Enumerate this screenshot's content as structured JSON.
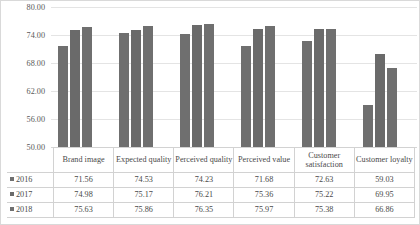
{
  "chart_data": {
    "type": "bar",
    "title": "",
    "xlabel": "",
    "ylabel": "",
    "ylim": [
      50,
      80
    ],
    "yticks": [
      "80.00",
      "74.00",
      "68.00",
      "62.00",
      "56.00",
      "50.00"
    ],
    "ytick_values": [
      80,
      74,
      68,
      62,
      56,
      50
    ],
    "grid": true,
    "legend_position": "data-table-left",
    "categories": [
      "Brand image",
      "Expected quality",
      "Perceived quality",
      "Perceived value",
      "Customer satisfaction",
      "Customer loyalty"
    ],
    "series": [
      {
        "name": "2016",
        "color": "#6f6f6f",
        "values": [
          71.56,
          74.53,
          74.23,
          71.68,
          72.63,
          59.03
        ]
      },
      {
        "name": "2017",
        "color": "#6a6a6a",
        "values": [
          74.98,
          75.17,
          76.21,
          75.36,
          75.22,
          69.95
        ]
      },
      {
        "name": "2018",
        "color": "#6f6f6f",
        "values": [
          75.63,
          75.86,
          76.35,
          75.97,
          75.38,
          66.86
        ]
      }
    ],
    "table": {
      "row_labels": [
        "2016",
        "2017",
        "2018"
      ],
      "rows": [
        [
          "71.56",
          "74.53",
          "74.23",
          "71.68",
          "72.63",
          "59.03"
        ],
        [
          "74.98",
          "75.17",
          "76.21",
          "75.36",
          "75.22",
          "69.95"
        ],
        [
          "75.63",
          "75.86",
          "76.35",
          "75.97",
          "75.38",
          "66.86"
        ]
      ]
    }
  }
}
